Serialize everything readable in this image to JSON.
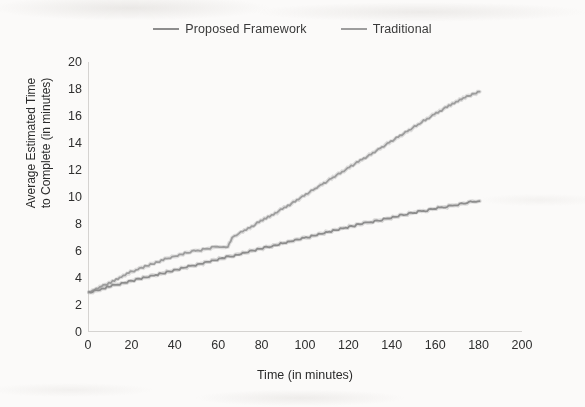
{
  "legend": {
    "position": "top-center",
    "entries": [
      {
        "label": "Proposed Framework",
        "color": "#8d8d8d",
        "icon": "line-swatch-icon"
      },
      {
        "label": "Traditional",
        "color": "#9d9d9d",
        "icon": "line-swatch-icon"
      }
    ]
  },
  "axes": {
    "x_title": "Time (in minutes)",
    "y_title_line1": "Average Estimated Time",
    "y_title_line2": "to Complete (in minutes)",
    "x_ticks": [
      "0",
      "20",
      "40",
      "60",
      "80",
      "100",
      "120",
      "140",
      "160",
      "180",
      "200"
    ],
    "y_ticks": [
      "0",
      "2",
      "4",
      "6",
      "8",
      "10",
      "12",
      "14",
      "16",
      "18",
      "20"
    ]
  },
  "chart_data": {
    "type": "line",
    "title": "",
    "subtitle": "",
    "xlabel": "Time (in minutes)",
    "ylabel": "Average Estimated Time to Complete (in minutes)",
    "xlim": [
      0,
      200
    ],
    "ylim": [
      0,
      20
    ],
    "xtick_step": 20,
    "ytick_step": 2,
    "grid": false,
    "legend_position": "top-center",
    "annotations": [],
    "series": [
      {
        "name": "Traditional",
        "color": "#9d9d9d",
        "x": [
          0,
          5,
          10,
          15,
          20,
          25,
          30,
          35,
          40,
          45,
          50,
          55,
          60,
          64,
          66,
          70,
          75,
          80,
          85,
          90,
          95,
          100,
          105,
          110,
          115,
          120,
          125,
          130,
          135,
          140,
          145,
          150,
          155,
          160,
          165,
          170,
          175,
          180
        ],
        "y": [
          2.9,
          3.3,
          3.7,
          4.1,
          4.5,
          4.8,
          5.1,
          5.4,
          5.6,
          5.9,
          6.0,
          6.2,
          6.3,
          6.35,
          7.0,
          7.4,
          7.8,
          8.3,
          8.7,
          9.2,
          9.7,
          10.2,
          10.7,
          11.2,
          11.7,
          12.2,
          12.7,
          13.2,
          13.7,
          14.2,
          14.7,
          15.2,
          15.7,
          16.2,
          16.7,
          17.1,
          17.5,
          17.8
        ]
      },
      {
        "name": "Proposed Framework",
        "color": "#8d8d8d",
        "x": [
          0,
          5,
          10,
          15,
          20,
          25,
          30,
          35,
          40,
          45,
          50,
          55,
          60,
          65,
          70,
          75,
          80,
          85,
          90,
          95,
          100,
          105,
          110,
          115,
          120,
          125,
          130,
          135,
          140,
          145,
          150,
          155,
          160,
          165,
          170,
          175,
          180
        ],
        "y": [
          2.9,
          3.15,
          3.4,
          3.6,
          3.8,
          4.0,
          4.2,
          4.4,
          4.6,
          4.8,
          5.0,
          5.2,
          5.4,
          5.6,
          5.8,
          6.0,
          6.2,
          6.4,
          6.6,
          6.8,
          7.0,
          7.2,
          7.4,
          7.6,
          7.8,
          8.0,
          8.15,
          8.3,
          8.5,
          8.7,
          8.85,
          9.0,
          9.15,
          9.3,
          9.45,
          9.6,
          9.7
        ]
      }
    ]
  }
}
